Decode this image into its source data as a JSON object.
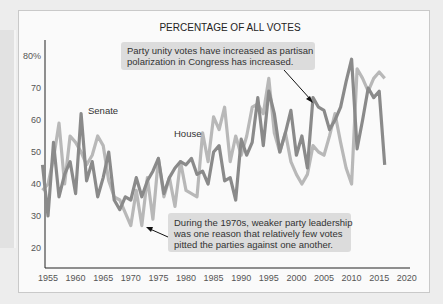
{
  "chart_data": {
    "type": "line",
    "title": "PERCENTAGE OF ALL VOTES",
    "xlabel": "",
    "ylabel": "",
    "xlim": [
      1954,
      2020
    ],
    "ylim": [
      15,
      85
    ],
    "grid": false,
    "x_ticks": [
      "1955",
      "1960",
      "1965",
      "1970",
      "1975",
      "1980",
      "1985",
      "1990",
      "1995",
      "2000",
      "2005",
      "2010",
      "2015",
      "2020"
    ],
    "y_ticks": [
      "80%",
      "70",
      "60",
      "50",
      "40",
      "30",
      "20"
    ],
    "x": [
      1954,
      1955,
      1956,
      1957,
      1958,
      1959,
      1960,
      1961,
      1962,
      1963,
      1964,
      1965,
      1966,
      1967,
      1968,
      1969,
      1970,
      1971,
      1972,
      1973,
      1974,
      1975,
      1976,
      1977,
      1978,
      1979,
      1980,
      1981,
      1982,
      1983,
      1984,
      1985,
      1986,
      1987,
      1988,
      1989,
      1990,
      1991,
      1992,
      1993,
      1994,
      1995,
      1996,
      1997,
      1998,
      1999,
      2000,
      2001,
      2002,
      2003,
      2004,
      2005,
      2006,
      2007,
      2008,
      2009,
      2010,
      2011,
      2012,
      2013,
      2014,
      2015,
      2016
    ],
    "series": [
      {
        "name": "Senate",
        "color": "#8a8a8a",
        "values": [
          46,
          30,
          53,
          36,
          43,
          47,
          37,
          62,
          41,
          47,
          36,
          42,
          50,
          35,
          32,
          36,
          35,
          42,
          36,
          41,
          44,
          48,
          37,
          42,
          45,
          47,
          46,
          48,
          43,
          44,
          40,
          50,
          52,
          41,
          42,
          35,
          54,
          49,
          53,
          67,
          52,
          69,
          62,
          50,
          56,
          63,
          49,
          55,
          45,
          67,
          64,
          63,
          57,
          60,
          64,
          72,
          79,
          51,
          60,
          70,
          67,
          69,
          46
        ]
      },
      {
        "name": "House",
        "color": "#b8b8b8",
        "values": [
          38,
          40,
          48,
          59,
          40,
          55,
          53,
          50,
          46,
          49,
          55,
          52,
          41,
          36,
          35,
          31,
          27,
          38,
          27,
          42,
          29,
          48,
          36,
          42,
          33,
          47,
          38,
          37,
          36,
          56,
          47,
          61,
          57,
          64,
          47,
          55,
          49,
          55,
          64,
          65,
          62,
          73,
          56,
          50,
          56,
          47,
          43,
          40,
          43,
          52,
          50,
          49,
          55,
          62,
          53,
          45,
          40,
          76,
          73,
          69,
          73,
          75,
          73
        ]
      }
    ],
    "annotations": [
      {
        "text": "Party unity votes have increased as partisan polarization in Congress has increased.",
        "points_to": [
          2003,
          67
        ]
      },
      {
        "text": "During the 1970s, weaker party leadership was one reason that relatively few votes pitted the parties against one another.",
        "points_to": [
          1972,
          27
        ]
      }
    ],
    "series_labels": [
      {
        "text": "Senate",
        "x": 1962,
        "y": 61
      },
      {
        "text": "House",
        "x": 1979,
        "y": 53
      }
    ]
  },
  "text": {
    "title": "PERCENTAGE OF ALL VOTES",
    "senate_label": "Senate",
    "house_label": "House",
    "note_top_line1": "Party unity votes have increased as partisan",
    "note_top_line2": "polarization in Congress has increased.",
    "note_bottom_line1": "During the 1970s, weaker party leadership",
    "note_bottom_line2": "was one reason that relatively few votes",
    "note_bottom_line3": "pitted the parties against one another."
  }
}
